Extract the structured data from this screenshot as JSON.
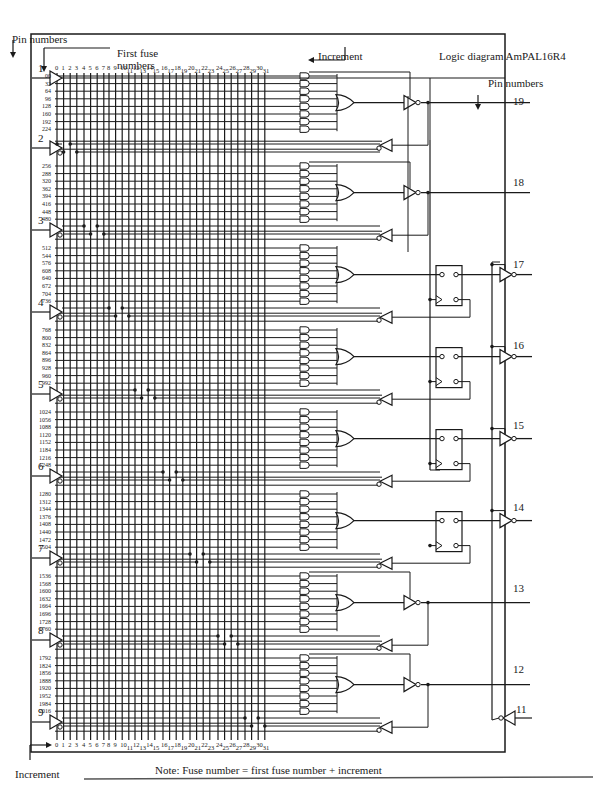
{
  "title": "Logic diagram AmPAL16R4",
  "labels": {
    "pin_numbers_left": "Pin numbers",
    "pin_numbers_right": "Pin numbers",
    "first_fuse_line1": "First fuse",
    "first_fuse_line2": "numbers",
    "increment_top": "Increment",
    "increment_bottom": "Increment",
    "note": "Note: Fuse number  =  first fuse number  +  increment"
  },
  "input_pins": [
    "1",
    "2",
    "3",
    "4",
    "5",
    "6",
    "7",
    "8",
    "9"
  ],
  "output_pins": {
    "combinational_top": [
      "19",
      "18"
    ],
    "registered": [
      "17",
      "16",
      "15",
      "14"
    ],
    "combinational_bottom": [
      "13",
      "12"
    ],
    "output_enable": "11"
  },
  "column_increments": [
    "0",
    "1",
    "2",
    "3",
    "4",
    "5",
    "6",
    "7",
    "8",
    "9",
    "10",
    "11",
    "12",
    "13",
    "14",
    "15",
    "16",
    "17",
    "18",
    "19",
    "20",
    "21",
    "22",
    "23",
    "24",
    "25",
    "26",
    "27",
    "28",
    "29",
    "30",
    "31"
  ],
  "fuse_groups": [
    {
      "output_pin": "19",
      "type": "combinational",
      "first_fuse_numbers": [
        "00",
        "32",
        "64",
        "96",
        "128",
        "160",
        "192",
        "224"
      ]
    },
    {
      "output_pin": "18",
      "type": "combinational",
      "first_fuse_numbers": [
        "256",
        "288",
        "320",
        "362",
        "394",
        "416",
        "448",
        "480"
      ]
    },
    {
      "output_pin": "17",
      "type": "registered",
      "first_fuse_numbers": [
        "512",
        "544",
        "576",
        "608",
        "640",
        "672",
        "704",
        "736"
      ]
    },
    {
      "output_pin": "16",
      "type": "registered",
      "first_fuse_numbers": [
        "768",
        "800",
        "832",
        "864",
        "896",
        "928",
        "960",
        "992"
      ]
    },
    {
      "output_pin": "15",
      "type": "registered",
      "first_fuse_numbers": [
        "1024",
        "1056",
        "1088",
        "1120",
        "1152",
        "1184",
        "1216",
        "1248"
      ]
    },
    {
      "output_pin": "14",
      "type": "registered",
      "first_fuse_numbers": [
        "1280",
        "1312",
        "1344",
        "1376",
        "1408",
        "1440",
        "1472",
        "1504"
      ]
    },
    {
      "output_pin": "13",
      "type": "combinational",
      "first_fuse_numbers": [
        "1536",
        "1568",
        "1600",
        "1632",
        "1664",
        "1696",
        "1728",
        "1760"
      ]
    },
    {
      "output_pin": "12",
      "type": "combinational",
      "first_fuse_numbers": [
        "1792",
        "1824",
        "1856",
        "1888",
        "1920",
        "1952",
        "1984",
        "2016"
      ]
    }
  ],
  "colors": {
    "ink": "#1a1a1a",
    "paper": "#ffffff",
    "rule": "#555555"
  }
}
